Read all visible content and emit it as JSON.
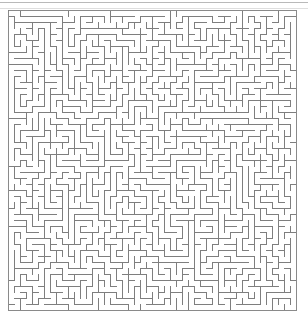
{
  "page": {
    "width": 308,
    "height": 324,
    "background_color": "#ffffff"
  },
  "top_rule": {
    "present": true,
    "color": "#b9b9b9",
    "secondary_color": "#dedede",
    "note": ""
  },
  "maze": {
    "title": "",
    "type": "perfect-maze",
    "line_color": "#7e7e7e",
    "border_color": "#8a8a8a",
    "background_color": "#ffffff",
    "line_width_px": 1,
    "cell_size_px": 6,
    "origin_x_px": 8,
    "origin_y_px": 10,
    "cols": 48,
    "rows": 50,
    "width_px": 288,
    "height_px": 300,
    "entrance": {
      "side": "top",
      "cell_index": 0
    },
    "exit": {
      "side": "bottom",
      "cell_index": 47
    },
    "seed": 20240607
  }
}
